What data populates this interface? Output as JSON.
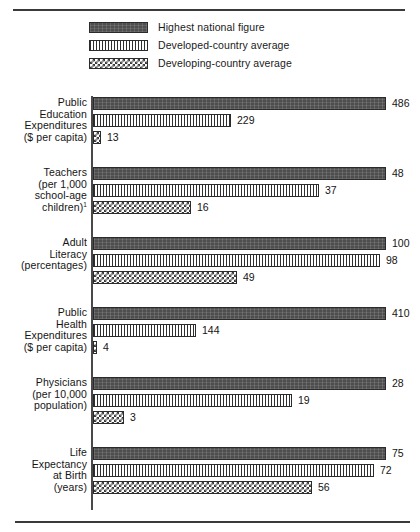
{
  "legend": {
    "items": [
      {
        "label": "Highest national figure",
        "pattern": "solid",
        "swatch_name": "legend-swatch-highest"
      },
      {
        "label": "Developed-country average",
        "pattern": "vlines",
        "swatch_name": "legend-swatch-developed"
      },
      {
        "label": "Developing-country average",
        "pattern": "check",
        "swatch_name": "legend-swatch-developing"
      }
    ]
  },
  "chart_data": {
    "type": "bar",
    "orientation": "horizontal",
    "title": "",
    "subtitle": "",
    "xlabel": "",
    "ylabel": "",
    "grid": false,
    "legend_position": "top",
    "note": "Each category group is scaled independently; the Highest national figure bar spans the full plot width in every group.",
    "series": [
      {
        "name": "Highest national figure",
        "pattern": "solid",
        "values": [
          486,
          48,
          100,
          410,
          28,
          75
        ]
      },
      {
        "name": "Developed-country average",
        "pattern": "vlines",
        "values": [
          229,
          37,
          98,
          144,
          19,
          72
        ]
      },
      {
        "name": "Developing-country average",
        "pattern": "check",
        "values": [
          13,
          16,
          49,
          4,
          3,
          56
        ]
      }
    ],
    "categories": [
      "Public Education Expenditures ($ per capita)",
      "Teachers (per 1,000 school-age children)",
      "Adult Literacy (percentages)",
      "Public Health Expenditures ($ per capita)",
      "Physicians (per 10,000 population)",
      "Life Expectancy at Birth (years)"
    ],
    "groups": [
      {
        "label_lines": [
          "Public",
          "Education",
          "Expenditures",
          "($ per capita)"
        ],
        "footnote_marker": "",
        "max": 486,
        "bars": [
          {
            "series": "Highest national figure",
            "pattern": "solid",
            "value": 486,
            "value_label": "486"
          },
          {
            "series": "Developed-country average",
            "pattern": "vlines",
            "value": 229,
            "value_label": "229"
          },
          {
            "series": "Developing-country average",
            "pattern": "check",
            "value": 13,
            "value_label": "13"
          }
        ]
      },
      {
        "label_lines": [
          "Teachers",
          "(per 1,000",
          "school-age",
          "children)"
        ],
        "footnote_marker": "1",
        "max": 48,
        "bars": [
          {
            "series": "Highest national figure",
            "pattern": "solid",
            "value": 48,
            "value_label": "48"
          },
          {
            "series": "Developed-country average",
            "pattern": "vlines",
            "value": 37,
            "value_label": "37"
          },
          {
            "series": "Developing-country average",
            "pattern": "check",
            "value": 16,
            "value_label": "16"
          }
        ]
      },
      {
        "label_lines": [
          "Adult",
          "Literacy",
          "(percentages)"
        ],
        "footnote_marker": "",
        "max": 100,
        "bars": [
          {
            "series": "Highest national figure",
            "pattern": "solid",
            "value": 100,
            "value_label": "100"
          },
          {
            "series": "Developed-country average",
            "pattern": "vlines",
            "value": 98,
            "value_label": "98"
          },
          {
            "series": "Developing-country average",
            "pattern": "check",
            "value": 49,
            "value_label": "49"
          }
        ]
      },
      {
        "label_lines": [
          "Public",
          "Health",
          "Expenditures",
          "($ per capita)"
        ],
        "footnote_marker": "",
        "max": 410,
        "bars": [
          {
            "series": "Highest national figure",
            "pattern": "solid",
            "value": 410,
            "value_label": "410"
          },
          {
            "series": "Developed-country average",
            "pattern": "vlines",
            "value": 144,
            "value_label": "144"
          },
          {
            "series": "Developing-country average",
            "pattern": "check",
            "value": 4,
            "value_label": "4"
          }
        ]
      },
      {
        "label_lines": [
          "Physicians",
          "(per 10,000",
          "population)"
        ],
        "footnote_marker": "",
        "max": 28,
        "bars": [
          {
            "series": "Highest national figure",
            "pattern": "solid",
            "value": 28,
            "value_label": "28"
          },
          {
            "series": "Developed-country average",
            "pattern": "vlines",
            "value": 19,
            "value_label": "19"
          },
          {
            "series": "Developing-country average",
            "pattern": "check",
            "value": 3,
            "value_label": "3"
          }
        ]
      },
      {
        "label_lines": [
          "Life",
          "Expectancy",
          "at Birth",
          "(years)"
        ],
        "footnote_marker": "",
        "max": 75,
        "bars": [
          {
            "series": "Highest national figure",
            "pattern": "solid",
            "value": 75,
            "value_label": "75"
          },
          {
            "series": "Developed-country average",
            "pattern": "vlines",
            "value": 72,
            "value_label": "72"
          },
          {
            "series": "Developing-country average",
            "pattern": "check",
            "value": 56,
            "value_label": "56"
          }
        ]
      }
    ]
  },
  "layout": {
    "plot_left": 96,
    "plot_full_width": 293,
    "group_tops": [
      0,
      70,
      140,
      210,
      280,
      350
    ],
    "colors": {
      "ink": "#1a1a1a",
      "rule": "#3a3a3a",
      "solid_fill": "#4e4e4e",
      "hatch_ink": "#2f2f2f",
      "check_ink": "#3a3a3a",
      "paper": "#ffffff"
    }
  }
}
